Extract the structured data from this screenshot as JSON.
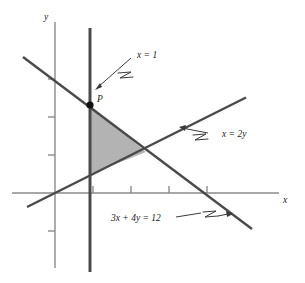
{
  "figure": {
    "type": "math-diagram",
    "background_color": "#ffffff",
    "line_color": "#4a4a4a",
    "axis_color": "#8a8a8a",
    "region_fill_color": "#b3b3b3",
    "region_stroke_color": "#6e6e6e",
    "point_color": "#111111"
  },
  "axes": {
    "x_label": "x",
    "y_label": "y",
    "origin_px": [
      55,
      193
    ],
    "unit_px": 38,
    "x_ticks": [
      1,
      2,
      3,
      4
    ],
    "y_ticks": [
      1,
      2,
      3,
      4
    ],
    "grid": "off"
  },
  "lines": [
    {
      "id": "x-equals-1",
      "label": "x = 1",
      "equation": "x = 1",
      "orientation": "vertical",
      "x_value": 1
    },
    {
      "id": "x-equals-2y",
      "label": "x = 2y",
      "equation": "x = 2y",
      "slope": 0.5,
      "intercept": 0
    },
    {
      "id": "three-x-plus-four-y",
      "label": "3x + 4y = 12",
      "equation": "3x + 4y = 12",
      "slope": -0.75,
      "intercept": 3
    }
  ],
  "points": [
    {
      "id": "point-p",
      "label": "P",
      "x": 1,
      "y": 2.25,
      "description": "intersection of x = 1 and 3x + 4y = 12"
    }
  ],
  "region": {
    "id": "feasible-region",
    "label": "",
    "fill": "#b3b3b3",
    "vertices": [
      [
        1,
        2.25
      ],
      [
        1,
        0.5
      ],
      [
        2.4,
        1.2
      ]
    ]
  },
  "annotations": [
    {
      "id": "annotation-x-equals-1",
      "text": "x = 1",
      "pointer": "arrow",
      "target": "x-equals-1"
    },
    {
      "id": "annotation-x-equals-2y",
      "text": "x = 2y",
      "pointer": "arrow",
      "target": "x-equals-2y"
    },
    {
      "id": "annotation-3x-4y-12",
      "text": "3x + 4y = 12",
      "pointer": "arrow",
      "target": "three-x-plus-four-y"
    }
  ]
}
